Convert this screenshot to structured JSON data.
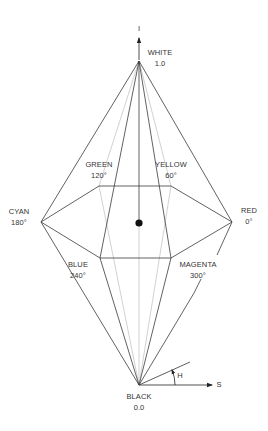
{
  "diagram": {
    "axes": {
      "intensity_label": "I",
      "saturation_label": "S",
      "hue_label": "H"
    },
    "apex_top": {
      "name": "WHITE",
      "value": "1.0"
    },
    "apex_bottom": {
      "name": "BLACK",
      "value": "0.0"
    },
    "hues": [
      {
        "name": "RED",
        "angle": "0°"
      },
      {
        "name": "YELLOW",
        "angle": "60°"
      },
      {
        "name": "GREEN",
        "angle": "120°"
      },
      {
        "name": "CYAN",
        "angle": "180°"
      },
      {
        "name": "BLUE",
        "angle": "240°"
      },
      {
        "name": "MAGENTA",
        "angle": "300°"
      }
    ],
    "colors": {
      "line_dark": "#333333",
      "line_light": "#b5b5b5",
      "text": "#333333",
      "background": "#ffffff"
    }
  }
}
